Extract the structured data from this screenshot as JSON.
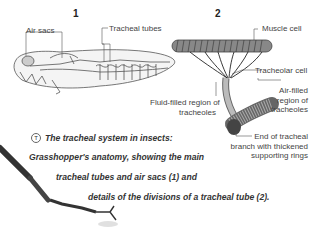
{
  "figure": {
    "panel_1": {
      "number": "1",
      "labels": {
        "air_sacs": "Air sacs",
        "tracheal_tubes": "Tracheal tubes"
      }
    },
    "panel_2": {
      "number": "2",
      "labels": {
        "muscle_cell": "Muscle cell",
        "tracheolar_cell": "Tracheolar cell",
        "air_filled_1": "Air-filled",
        "air_filled_2": "region of",
        "air_filled_3": "tracheoles",
        "fluid_filled_1": "Fluid-filled region of",
        "fluid_filled_2": "tracheoles",
        "end_branch_1": "End of tracheal",
        "end_branch_2": "branch with thickened",
        "end_branch_3": "supporting rings"
      }
    },
    "caption": {
      "icon": "T",
      "line_1": "The tracheal system in insects:",
      "line_2": "Grasshopper's anatomy, showing the main",
      "line_3": "tracheal tubes and air sacs (1) and",
      "line_4": "details of the divisions of a tracheal tube (2)."
    }
  }
}
